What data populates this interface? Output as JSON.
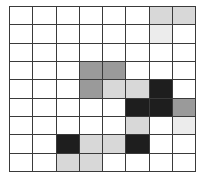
{
  "grid": {
    "columns": 8,
    "rows": 9,
    "line_color": "#3a3a3a",
    "palette": {
      "0": "#ffffff",
      "1": "#ececec",
      "2": "#d8d8d8",
      "3": "#9a9a9a",
      "4": "#1e1e1e"
    },
    "cells": [
      [
        0,
        0,
        0,
        0,
        0,
        0,
        2,
        2
      ],
      [
        0,
        0,
        0,
        0,
        0,
        0,
        1,
        0
      ],
      [
        0,
        0,
        0,
        0,
        0,
        0,
        0,
        0
      ],
      [
        0,
        0,
        0,
        3,
        3,
        0,
        0,
        0
      ],
      [
        0,
        0,
        0,
        3,
        2,
        2,
        4,
        0
      ],
      [
        0,
        0,
        0,
        0,
        0,
        4,
        4,
        3
      ],
      [
        0,
        0,
        0,
        0,
        0,
        2,
        0,
        1
      ],
      [
        0,
        0,
        4,
        2,
        2,
        4,
        0,
        0
      ],
      [
        0,
        0,
        2,
        2,
        0,
        0,
        0,
        0
      ]
    ]
  }
}
